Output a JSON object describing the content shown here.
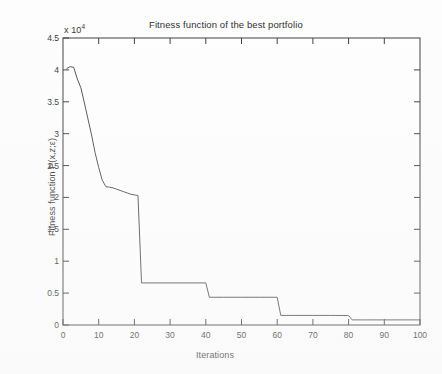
{
  "figure": {
    "title": "Fitness function of the best portfolio",
    "exponent_label": "x 10",
    "exponent_power": "4",
    "background_color": "#fdfdfd",
    "axis_color": "#3a3a3a",
    "line_color": "#4a4a4a"
  },
  "chart_data": {
    "type": "line",
    "title": "Fitness function of the best portfolio",
    "xlabel": "Iterations",
    "ylabel": "Fitness function P(x,z;ε)",
    "y_exponent": "x 10^4",
    "xlim": [
      0,
      100
    ],
    "ylim": [
      0,
      45000
    ],
    "xticks": [
      0,
      10,
      20,
      30,
      40,
      50,
      60,
      70,
      80,
      90,
      100
    ],
    "yticks": [
      0,
      5000,
      10000,
      15000,
      20000,
      25000,
      30000,
      35000,
      40000,
      45000
    ],
    "ytick_labels": [
      "0",
      "0.5",
      "1",
      "1.5",
      "2",
      "2.5",
      "3",
      "3.5",
      "4",
      "4.5"
    ],
    "xtick_labels": [
      "0",
      "10",
      "20",
      "30",
      "40",
      "50",
      "60",
      "70",
      "80",
      "90",
      "100"
    ],
    "grid": false,
    "legend": null,
    "series": [
      {
        "name": "best portfolio fitness",
        "x": [
          1,
          2,
          3,
          4,
          5,
          6,
          7,
          8,
          9,
          10,
          11,
          12,
          13,
          14,
          15,
          16,
          17,
          18,
          19,
          20,
          21,
          22,
          23,
          30,
          35,
          40,
          41,
          45,
          50,
          55,
          60,
          61,
          65,
          70,
          75,
          80,
          81,
          85,
          90,
          95,
          100
        ],
        "y": [
          40200,
          40500,
          40400,
          38600,
          37200,
          34800,
          32300,
          29800,
          27000,
          24700,
          22700,
          21700,
          21600,
          21500,
          21300,
          21100,
          20900,
          20700,
          20500,
          20400,
          20300,
          6600,
          6600,
          6600,
          6600,
          6600,
          4350,
          4350,
          4350,
          4350,
          4350,
          1500,
          1500,
          1500,
          1500,
          1480,
          800,
          800,
          800,
          800,
          800
        ]
      }
    ]
  },
  "axes": {
    "x_label": "Iterations",
    "y_label": "Fitness function P(x,z;ε)"
  }
}
